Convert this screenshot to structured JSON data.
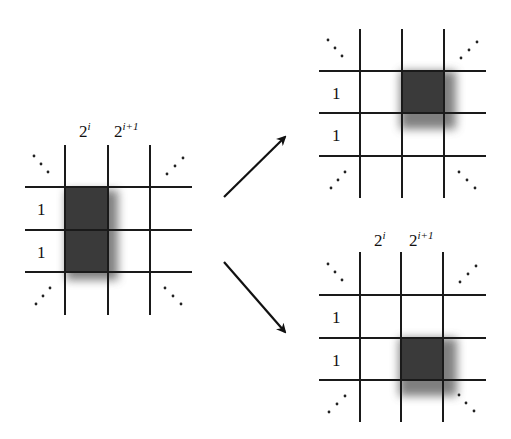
{
  "diagram": {
    "column_labels": [
      {
        "base": "2",
        "exponent": "i"
      },
      {
        "base": "2",
        "exponent": "i+1"
      }
    ],
    "row_labels": [
      "1",
      "1"
    ],
    "ellipsis": "⋱",
    "anti_ellipsis": "⋰",
    "grids": [
      {
        "id": "left",
        "shaded": "column 2^i, both rows",
        "shows_column_labels": true
      },
      {
        "id": "top-right",
        "shaded": "column 2^{i+1}, top row",
        "shows_column_labels": false
      },
      {
        "id": "bottom-right",
        "shaded": "column 2^{i+1}, bottom row",
        "shows_column_labels": true
      }
    ],
    "arrows": [
      {
        "from": "left",
        "to": "top-right",
        "direction": "up-right"
      },
      {
        "from": "left",
        "to": "bottom-right",
        "direction": "down-right"
      }
    ],
    "colors": {
      "line": "#1a1a1a",
      "shade": "#3a3a3a",
      "background": "#ffffff"
    }
  }
}
